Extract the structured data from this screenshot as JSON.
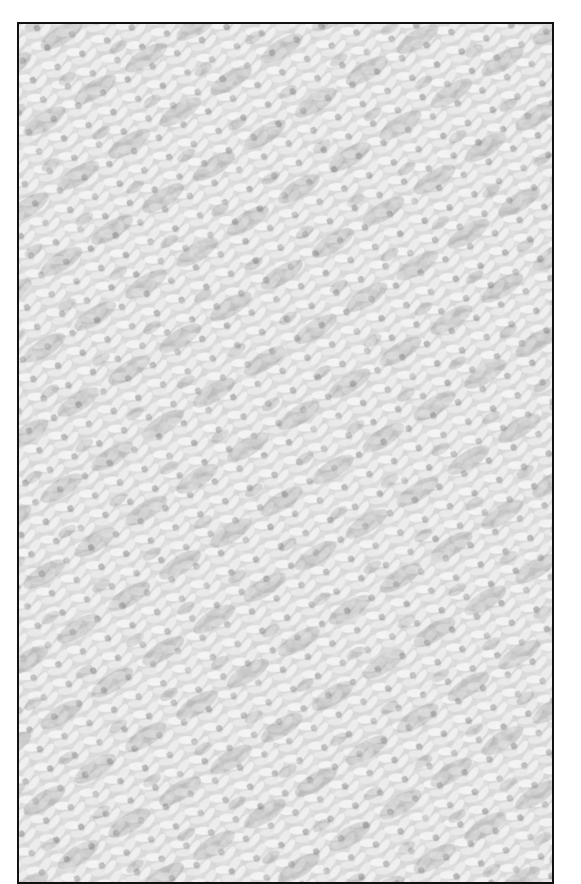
{
  "image": {
    "subject": "knitted fabric texture close-up",
    "tone": "grayscale",
    "colors": {
      "border": "#111111",
      "yarn_light": "#f2f2f2",
      "yarn_mid": "#c8c8c8",
      "shadow": "#6e6e6e",
      "background": "#ffffff"
    },
    "frame": {
      "left": 17,
      "top": 22,
      "width": 535,
      "height": 860
    }
  }
}
